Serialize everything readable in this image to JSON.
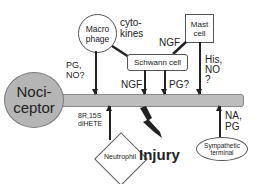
{
  "diagram": {
    "nodes": {
      "nociceptor": "Noci-\nceptor",
      "macrophage": "Macro\nphage",
      "mast_cell": "Mast\ncell",
      "schwann_cell": "Schwann cell",
      "neutrophil": "Neutrophil",
      "sympathetic_terminal": "Sympathetic\nterminal",
      "injury": "Injury"
    },
    "labels": {
      "macrophage_to_axon": "PG,\nNO?",
      "macrophage_to_schwann": "cyto-\nkines",
      "mast_to_schwann": "NGF",
      "schwann_to_axon_ngf": "NGF",
      "schwann_to_axon_pg": "PG?",
      "mast_to_axon": "His,\nNO\n?",
      "neutrophil_to_axon": "8R,15S\ndiHETE",
      "sympathetic_to_axon": "NA,\nPG"
    }
  }
}
